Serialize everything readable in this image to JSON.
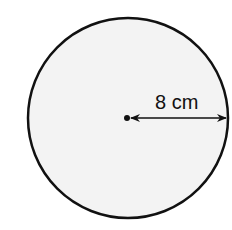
{
  "diagram": {
    "shape": "circle",
    "center": {
      "x": 128,
      "y": 118
    },
    "radius_px": 101,
    "fill_color": "#f3f3f3",
    "stroke_color": "#111111",
    "radius_label": "8 cm",
    "measurement": {
      "type": "radius",
      "value": 8,
      "unit": "cm"
    }
  }
}
